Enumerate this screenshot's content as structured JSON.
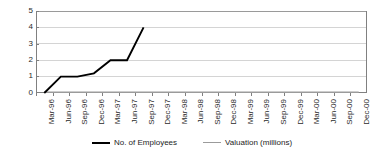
{
  "chart_data": {
    "type": "line",
    "title": "",
    "xlabel": "",
    "ylabel": "",
    "ylim": [
      0,
      5
    ],
    "yticks": [
      0,
      1,
      2,
      3,
      4,
      5
    ],
    "grid": true,
    "legend_position": "bottom",
    "categories": [
      "Mar-96",
      "Jun-96",
      "Sep-96",
      "Dec-96",
      "Mar-97",
      "Jun-97",
      "Sep-97",
      "Dec-97",
      "Mar-98",
      "Jun-98",
      "Sep-98",
      "Dec-98",
      "Mar-99",
      "Jun-99",
      "Sep-99",
      "Dec-99",
      "Mar-00",
      "Jun-00",
      "Sep-00",
      "Dec-00"
    ],
    "series": [
      {
        "name": "No. of Employees",
        "color": "#000000",
        "values": [
          0,
          1,
          1,
          1.2,
          2,
          2,
          4,
          null,
          null,
          null,
          null,
          null,
          null,
          null,
          null,
          null,
          null,
          null,
          null,
          null
        ]
      },
      {
        "name": "Valuation (millions)",
        "color": "#9b9b9b",
        "values": [
          0.05,
          0.05,
          0.05,
          0.05,
          0.05,
          0.05,
          0.05,
          0.05,
          0.05,
          0.05,
          0.05,
          0.05,
          0.05,
          0.05,
          0.05,
          0.05,
          0.05,
          0.05,
          0.05,
          0.05
        ]
      }
    ]
  },
  "legend": {
    "entries": [
      {
        "label": "No. of Employees"
      },
      {
        "label": "Valuation (millions)"
      }
    ]
  }
}
